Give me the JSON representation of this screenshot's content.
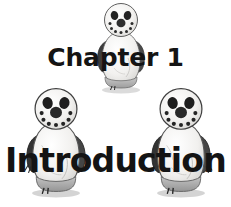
{
  "page": {
    "background_color": "#ffffff",
    "width": 231,
    "height": 207
  },
  "heading": {
    "chapter_label": "Chapter 1",
    "chapter_title": "Introduction",
    "text_color": "#141414"
  },
  "illustrations": [
    {
      "name": "penguin-top",
      "icon": "penguin-figure-icon",
      "description": "grayscale penguin snowman illustration, centered above chapter label",
      "body_color": "#efeeec",
      "wing_color": "#3a3a3a",
      "base_color": "#b5b5b5",
      "face_color": "#2b2b2b"
    },
    {
      "name": "penguin-left",
      "icon": "penguin-figure-icon",
      "description": "grayscale penguin snowman illustration, lower left",
      "body_color": "#efeeec",
      "wing_color": "#3a3a3a",
      "base_color": "#b5b5b5",
      "face_color": "#2b2b2b"
    },
    {
      "name": "penguin-right",
      "icon": "penguin-figure-icon",
      "description": "grayscale penguin snowman illustration, lower right",
      "body_color": "#efeeec",
      "wing_color": "#3a3a3a",
      "base_color": "#b5b5b5",
      "face_color": "#2b2b2b"
    }
  ]
}
